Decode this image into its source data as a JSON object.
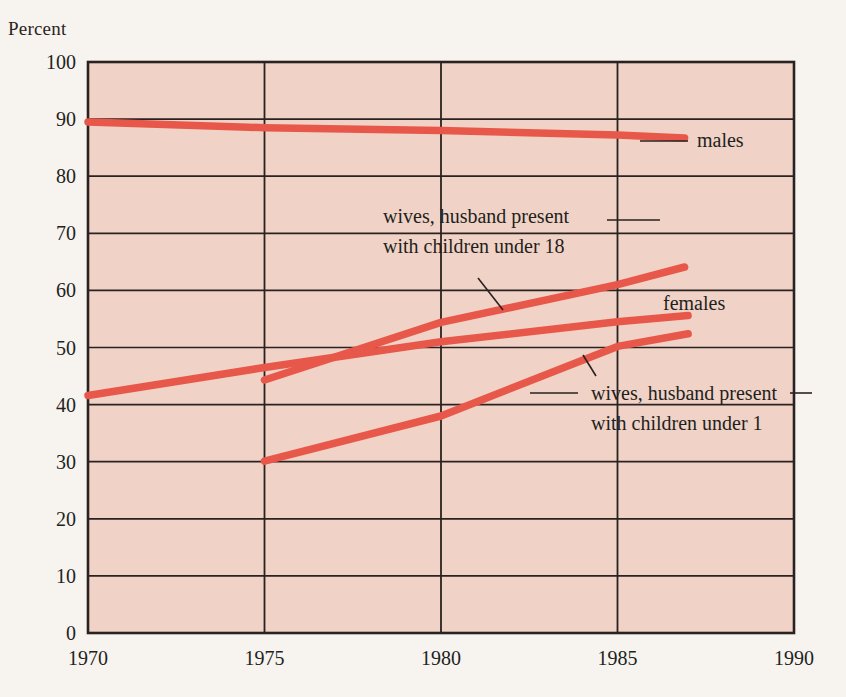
{
  "axis_unit_label": "Percent",
  "chart_data": {
    "type": "line",
    "title": "",
    "subtitle": "",
    "xlabel": "",
    "ylabel": "Percent",
    "xlim": [
      1970,
      1990
    ],
    "ylim": [
      0,
      100
    ],
    "grid": true,
    "legend_position": "inline-annotations",
    "background_color": "#f0d3c6",
    "line_color": "#e8584a",
    "axis_color": "#2a2220",
    "x_ticks": [
      1970,
      1975,
      1980,
      1985,
      1990
    ],
    "x_tick_labels": [
      "1970",
      "1975",
      "1980",
      "1985",
      "1990"
    ],
    "y_ticks": [
      0,
      10,
      20,
      30,
      40,
      50,
      60,
      70,
      80,
      90,
      100
    ],
    "y_tick_labels": [
      "0",
      "10",
      "20",
      "30",
      "40",
      "50",
      "60",
      "70",
      "80",
      "90",
      "100"
    ],
    "series": [
      {
        "name": "males",
        "label": "males",
        "x": [
          1970,
          1975,
          1980,
          1985,
          1986.9
        ],
        "values": [
          89.5,
          88.5,
          88.0,
          87.2,
          86.7
        ]
      },
      {
        "name": "females",
        "label": "females",
        "x": [
          1970,
          1975,
          1980,
          1985,
          1987.0
        ],
        "values": [
          41.6,
          46.5,
          51.0,
          54.5,
          55.6
        ]
      },
      {
        "name": "wives, husband present with children under 18",
        "label": "wives, husband present with children under 18",
        "x": [
          1975,
          1980,
          1985,
          1986.9
        ],
        "values": [
          44.3,
          54.4,
          61.0,
          64.1
        ]
      },
      {
        "name": "wives, husband present with children under 1",
        "label": "wives, husband present with children under 1",
        "x": [
          1975,
          1980,
          1985,
          1987.0
        ],
        "values": [
          30.1,
          38.0,
          50.2,
          52.4
        ]
      }
    ],
    "annotations": [
      {
        "name": "males",
        "lines": [
          "males"
        ],
        "x": 1990,
        "y": 87
      },
      {
        "name": "females",
        "lines": [
          "females"
        ],
        "x": 1987,
        "y": 57
      },
      {
        "name": "wives-under-18",
        "lines": [
          "wives, husband present",
          "with children under 18"
        ],
        "x": 1980,
        "y": 71
      },
      {
        "name": "wives-under-1",
        "lines": [
          "wives, husband present",
          "with children under 1"
        ],
        "x": 1985,
        "y": 43
      }
    ]
  }
}
